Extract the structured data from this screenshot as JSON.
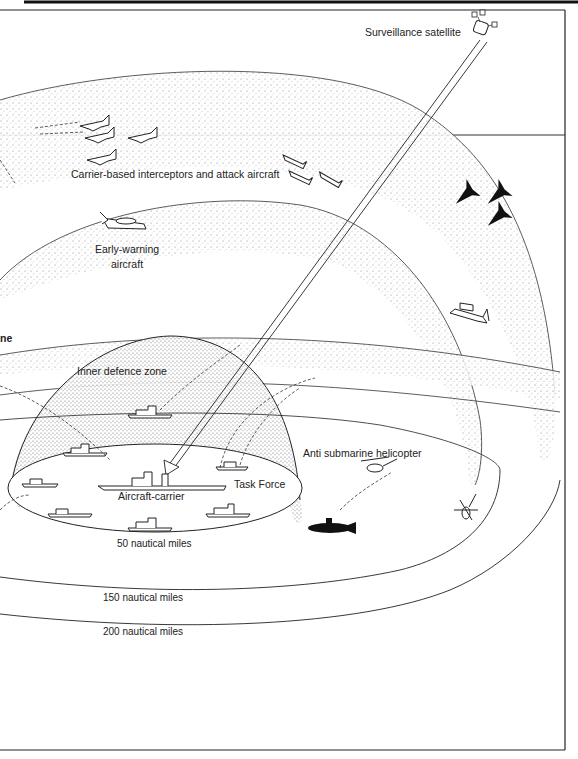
{
  "diagram": {
    "title_visible": false,
    "labels": {
      "satellite": "Surveillance satellite",
      "interceptors": "Carrier-based interceptors and attack aircraft",
      "early_warning_line1": "Early-warning",
      "early_warning_line2": "aircraft",
      "partial_left": "ne",
      "inner_zone": "Inner defence zone",
      "task_force": "Task Force",
      "carrier": "Aircraft-carrier",
      "helicopter": "Anti submarine helicopter",
      "range_50": "50 nautical miles",
      "range_150": "150 nautical miles",
      "range_200": "200 nautical miles"
    },
    "zones": [
      {
        "name": "inner-defence-zone",
        "radius_nm": 50
      },
      {
        "name": "middle-zone",
        "radius_nm": 150
      },
      {
        "name": "outer-zone",
        "radius_nm": 200
      }
    ],
    "elements": {
      "friendly_jets": 7,
      "enemy_jets": 3,
      "early_warning_aircraft": 1,
      "maritime_patrol_aircraft": 1,
      "escort_ships": 7,
      "aircraft_carrier": 1,
      "submarine": 1,
      "helicopters": 2,
      "satellite": 1
    },
    "colors": {
      "ink": "#1a1a1a",
      "stipple": "#555555",
      "paper": "#ffffff"
    }
  }
}
